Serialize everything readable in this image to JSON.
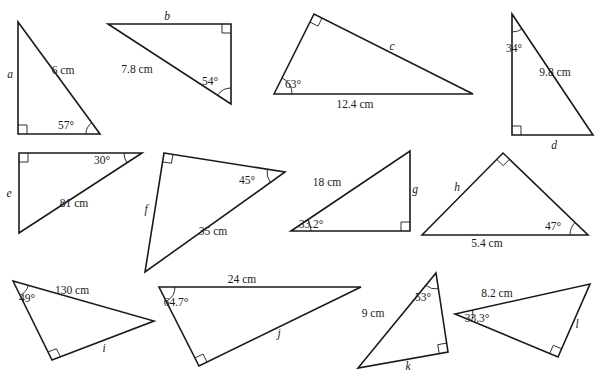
{
  "diagram": {
    "stroke_color": "#1a1a1a",
    "background": "#ffffff",
    "triangles": [
      {
        "id": "a",
        "vertices": [
          [
            18,
            22
          ],
          [
            18,
            134
          ],
          [
            100,
            134
          ]
        ],
        "right_angle_vertex": 1,
        "angle_vertex": 2,
        "angle_arc_radius": 14,
        "labels": [
          {
            "text": "a",
            "x": 10,
            "y": 78,
            "italic": true
          },
          {
            "text": "6 cm",
            "x": 63,
            "y": 74,
            "italic": false
          },
          {
            "text": "57°",
            "x": 66,
            "y": 129,
            "italic": false
          }
        ]
      },
      {
        "id": "b",
        "vertices": [
          [
            108,
            24
          ],
          [
            231,
            24
          ],
          [
            231,
            104
          ]
        ],
        "right_angle_vertex": 1,
        "angle_vertex": 2,
        "angle_arc_radius": 16,
        "labels": [
          {
            "text": "b",
            "x": 167,
            "y": 20,
            "italic": true
          },
          {
            "text": "7.8 cm",
            "x": 137,
            "y": 73,
            "italic": false
          },
          {
            "text": "54°",
            "x": 210,
            "y": 85,
            "italic": false
          }
        ]
      },
      {
        "id": "c",
        "vertices": [
          [
            274,
            94
          ],
          [
            314,
            14
          ],
          [
            473,
            94
          ]
        ],
        "right_angle_vertex": 1,
        "angle_vertex": 0,
        "angle_arc_radius": 18,
        "labels": [
          {
            "text": "c",
            "x": 392,
            "y": 50,
            "italic": true
          },
          {
            "text": "63°",
            "x": 293,
            "y": 88,
            "italic": false
          },
          {
            "text": "12.4 cm",
            "x": 355,
            "y": 108,
            "italic": false
          }
        ]
      },
      {
        "id": "d",
        "vertices": [
          [
            512,
            14
          ],
          [
            512,
            135
          ],
          [
            593,
            135
          ]
        ],
        "right_angle_vertex": 1,
        "angle_vertex": 0,
        "angle_arc_radius": 18,
        "labels": [
          {
            "text": "34°",
            "x": 514,
            "y": 52,
            "italic": false
          },
          {
            "text": "9.8 cm",
            "x": 555,
            "y": 76,
            "italic": false
          },
          {
            "text": "d",
            "x": 554,
            "y": 149,
            "italic": true
          }
        ]
      },
      {
        "id": "e",
        "vertices": [
          [
            19,
            153
          ],
          [
            142,
            153
          ],
          [
            19,
            233
          ]
        ],
        "right_angle_vertex": 0,
        "angle_vertex": 1,
        "angle_arc_radius": 18,
        "labels": [
          {
            "text": "e",
            "x": 9,
            "y": 197,
            "italic": true
          },
          {
            "text": "30°",
            "x": 102,
            "y": 164,
            "italic": false
          },
          {
            "text": "81 cm",
            "x": 74,
            "y": 207,
            "italic": false
          }
        ]
      },
      {
        "id": "f",
        "vertices": [
          [
            164,
            153
          ],
          [
            285,
            172
          ],
          [
            145,
            272
          ]
        ],
        "right_angle_vertex": 0,
        "angle_vertex": 1,
        "angle_arc_radius": 18,
        "labels": [
          {
            "text": "f",
            "x": 146,
            "y": 213,
            "italic": true
          },
          {
            "text": "45°",
            "x": 247,
            "y": 184,
            "italic": false
          },
          {
            "text": "35 cm",
            "x": 213,
            "y": 235,
            "italic": false
          }
        ]
      },
      {
        "id": "g",
        "vertices": [
          [
            291,
            231
          ],
          [
            410,
            151
          ],
          [
            410,
            231
          ]
        ],
        "right_angle_vertex": 2,
        "angle_vertex": 0,
        "angle_arc_radius": 20,
        "labels": [
          {
            "text": "18 cm",
            "x": 327,
            "y": 186,
            "italic": false
          },
          {
            "text": "g",
            "x": 415,
            "y": 193,
            "italic": true
          },
          {
            "text": "33.2°",
            "x": 311,
            "y": 228,
            "italic": false
          }
        ]
      },
      {
        "id": "h",
        "vertices": [
          [
            422,
            235
          ],
          [
            503,
            153
          ],
          [
            588,
            235
          ]
        ],
        "right_angle_vertex": 1,
        "angle_vertex": 2,
        "angle_arc_radius": 18,
        "labels": [
          {
            "text": "h",
            "x": 457,
            "y": 191,
            "italic": true
          },
          {
            "text": "47°",
            "x": 553,
            "y": 230,
            "italic": false
          },
          {
            "text": "5.4 cm",
            "x": 487,
            "y": 247,
            "italic": false
          }
        ]
      },
      {
        "id": "i",
        "vertices": [
          [
            13,
            281
          ],
          [
            52,
            360
          ],
          [
            154,
            321
          ]
        ],
        "right_angle_vertex": 1,
        "angle_vertex": 0,
        "angle_arc_radius": 16,
        "labels": [
          {
            "text": "130 cm",
            "x": 72,
            "y": 294,
            "italic": false
          },
          {
            "text": "49°",
            "x": 27,
            "y": 302,
            "italic": false
          },
          {
            "text": "i",
            "x": 104,
            "y": 352,
            "italic": true
          }
        ]
      },
      {
        "id": "j",
        "vertices": [
          [
            159,
            287
          ],
          [
            361,
            287
          ],
          [
            199,
            366
          ]
        ],
        "right_angle_vertex": 2,
        "angle_vertex": 0,
        "angle_arc_radius": 16,
        "labels": [
          {
            "text": "24 cm",
            "x": 242,
            "y": 283,
            "italic": false
          },
          {
            "text": "64.7°",
            "x": 176,
            "y": 306,
            "italic": false
          },
          {
            "text": "j",
            "x": 279,
            "y": 337,
            "italic": true
          }
        ]
      },
      {
        "id": "k",
        "vertices": [
          [
            436,
            273
          ],
          [
            448,
            352
          ],
          [
            358,
            368
          ]
        ],
        "right_angle_vertex": 1,
        "angle_vertex": 0,
        "angle_arc_radius": 16,
        "labels": [
          {
            "text": "53°",
            "x": 423,
            "y": 301,
            "italic": false
          },
          {
            "text": "9 cm",
            "x": 373,
            "y": 317,
            "italic": false
          },
          {
            "text": "k",
            "x": 408,
            "y": 370,
            "italic": true
          }
        ]
      },
      {
        "id": "l",
        "vertices": [
          [
            455,
            314
          ],
          [
            590,
            284
          ],
          [
            558,
            357
          ]
        ],
        "right_angle_vertex": 2,
        "angle_vertex": 0,
        "angle_arc_radius": 18,
        "labels": [
          {
            "text": "8.2 cm",
            "x": 497,
            "y": 297,
            "italic": false
          },
          {
            "text": "33.3°",
            "x": 477,
            "y": 322,
            "italic": false
          },
          {
            "text": "l",
            "x": 577,
            "y": 328,
            "italic": true
          }
        ]
      }
    ]
  }
}
